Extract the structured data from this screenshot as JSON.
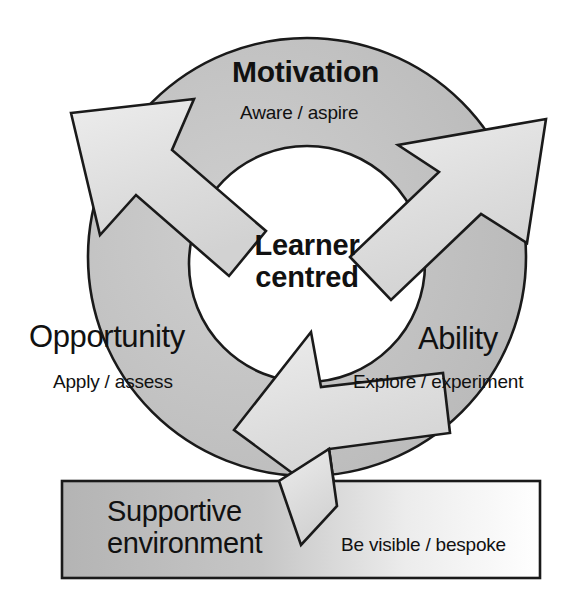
{
  "diagram": {
    "center": {
      "line1": "Learner",
      "line2": "centred"
    },
    "segments": [
      {
        "id": "motivation",
        "label": "Motivation",
        "subtitle": "Aware / aspire",
        "emphasis": "bold"
      },
      {
        "id": "ability",
        "label": "Ability",
        "subtitle": "Explore / experiment",
        "emphasis": "regular"
      },
      {
        "id": "opportunity",
        "label": "Opportunity",
        "subtitle": "Apply / assess",
        "emphasis": "regular"
      }
    ],
    "footer_box": {
      "title_line1": "Supportive",
      "title_line2": "environment",
      "subtitle": "Be visible / bespoke"
    },
    "arrows": [
      {
        "id": "arrow-upper-left",
        "direction": "up-left"
      },
      {
        "id": "arrow-upper-right",
        "direction": "up-right"
      },
      {
        "id": "arrow-lower",
        "direction": "down-left"
      }
    ],
    "colors": {
      "ring_fill": "#b5b5b5",
      "ring_fill_light": "#c9c9c9",
      "arrow_fill": "#dedede",
      "arrow_fill_light": "#f0f0f0",
      "box_fill_left": "#b8b8b8",
      "box_fill_right": "#ffffff",
      "stroke": "#1a1a1a",
      "text": "#111111",
      "background": "#ffffff"
    }
  }
}
